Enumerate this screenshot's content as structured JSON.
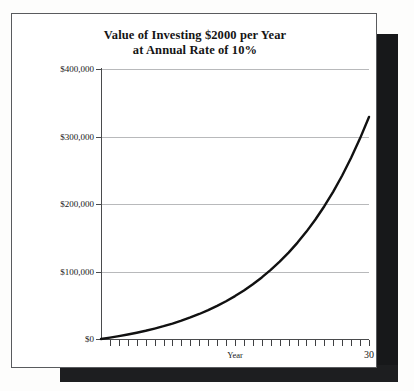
{
  "figure": {
    "title_line1": "Value of Investing $2000 per Year",
    "title_line2": "at Annual Rate of 10%"
  },
  "chart_data": {
    "type": "line",
    "title": "Value of Investing $2000 per Year at Annual Rate of 10%",
    "xlabel": "Year",
    "ylabel": "",
    "xlim": [
      0,
      30
    ],
    "ylim": [
      0,
      400000
    ],
    "grid": true,
    "legend": "none",
    "x_tick_labels": [
      "Year",
      "30"
    ],
    "y_tick_labels": [
      "$0",
      "$100,000",
      "$200,000",
      "$300,000",
      "$400,000"
    ],
    "y_tick_values": [
      0,
      100000,
      200000,
      300000,
      400000
    ],
    "series": [
      {
        "name": "Accumulated value",
        "color": "#111111",
        "x": [
          0,
          1,
          2,
          3,
          4,
          5,
          6,
          7,
          8,
          9,
          10,
          11,
          12,
          13,
          14,
          15,
          16,
          17,
          18,
          19,
          20,
          21,
          22,
          23,
          24,
          25,
          26,
          27,
          28,
          29,
          30
        ],
        "values": [
          0,
          2200,
          4620,
          7282,
          10210,
          13431,
          16974,
          20872,
          25159,
          29875,
          35062,
          40769,
          47045,
          53950,
          61545,
          69899,
          79089,
          89198,
          100318,
          112550,
          126005,
          140805,
          157086,
          174994,
          194694,
          216364,
          240200,
          266420,
          295262,
          326988,
          361887
        ]
      }
    ],
    "annotations": [
      "Curve reaches approximately $329,000 at year 30 as drawn"
    ]
  }
}
